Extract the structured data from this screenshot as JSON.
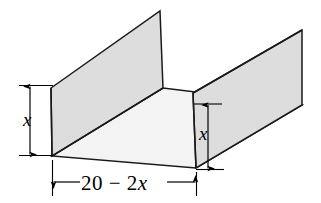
{
  "figure": {
    "type": "geometric-diagram",
    "shape": "U-shaped channel / open box, three-quarter isometric view",
    "colors": {
      "panel_fill": "#dedede",
      "floor_fill": "#f2f2f2",
      "outline": "#1a1a1a",
      "dimension_line": "#000000",
      "background": "#ffffff"
    },
    "dimensions": [
      {
        "id": "left-height",
        "label": "x",
        "italic": true,
        "orientation": "vertical",
        "position": "left side of figure",
        "measures": "height of left folded flap"
      },
      {
        "id": "right-height",
        "label": "x",
        "italic": true,
        "orientation": "vertical",
        "position": "inner right side of figure",
        "measures": "height of right folded flap"
      },
      {
        "id": "base-width",
        "label": "20 − 2x",
        "label_plain": "20 - 2x",
        "label_parts": [
          "20 − 2",
          "x"
        ],
        "italic_part": "x",
        "orientation": "horizontal",
        "position": "below front edge of base",
        "measures": "width of the box base"
      }
    ],
    "geometry": {
      "left_panel": [
        [
          51,
          88
        ],
        [
          160,
          11
        ],
        [
          163,
          88
        ],
        [
          52,
          156
        ]
      ],
      "floor": [
        [
          52,
          156
        ],
        [
          163,
          88
        ],
        [
          302,
          105
        ],
        [
          196,
          168
        ]
      ],
      "right_panel": [
        [
          193,
          93
        ],
        [
          302,
          30
        ],
        [
          302,
          105
        ],
        [
          196,
          168
        ]
      ]
    }
  }
}
